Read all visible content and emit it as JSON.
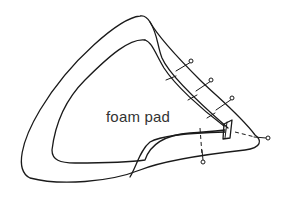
{
  "diagram": {
    "label": "foam pad",
    "pins": {
      "count": 5
    },
    "colors": {
      "line": "#1a1a1a",
      "background": "#ffffff",
      "text": "#333333"
    }
  }
}
